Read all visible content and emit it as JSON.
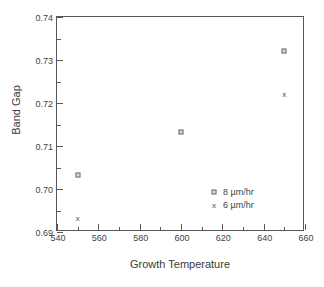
{
  "chart_data": {
    "type": "scatter",
    "title": "",
    "xlabel": "Growth Temperature",
    "ylabel": "Band Gap",
    "xlim": [
      540,
      660
    ],
    "ylim": [
      0.69,
      0.74
    ],
    "xticks": [
      540,
      560,
      580,
      600,
      620,
      640,
      660
    ],
    "xtick_labels": [
      "540",
      "560",
      "580",
      "600",
      "620",
      "640",
      "660"
    ],
    "yticks": [
      0.69,
      0.7,
      0.71,
      0.72,
      0.73,
      0.74
    ],
    "ytick_labels": [
      "0.69",
      "0.70",
      "0.71",
      "0.72",
      "0.73",
      "0.74"
    ],
    "x_minor_ticks": [
      550,
      570,
      590,
      610,
      630,
      650
    ],
    "y_minor_ticks": [
      0.695,
      0.705,
      0.715,
      0.725,
      0.735
    ],
    "grid": false,
    "legend_position": "lower right",
    "series": [
      {
        "name": "8  µm/hr",
        "marker": "square",
        "x": [
          550,
          600,
          650
        ],
        "y": [
          0.7032,
          0.7133,
          0.7322
        ]
      },
      {
        "name": "6  µm/hr",
        "marker": "x",
        "x": [
          550,
          650
        ],
        "y": [
          0.6932,
          0.7222
        ]
      }
    ]
  },
  "legend": {
    "entries": [
      {
        "label": "8  µm/hr",
        "marker": "square"
      },
      {
        "label": "6  µm/hr",
        "marker": "x"
      }
    ]
  },
  "axes": {
    "x_title": "Growth Temperature",
    "y_title": "Band Gap"
  },
  "colors": {
    "axis": "#585858",
    "text": "#3a3a3a",
    "marker": "#555555",
    "background": "#ffffff"
  }
}
